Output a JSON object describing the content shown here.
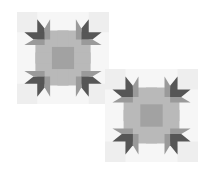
{
  "image": {
    "width": 209,
    "height": 174,
    "background": "#ffffff",
    "description": "Two overlapping grayscale quilt blocks (paw-style star pattern)"
  },
  "palette": {
    "corner_light": "#eeeeee",
    "field_light": "#f6f6f6",
    "octagon": "#b9b9b9",
    "center": "#a2a2a2",
    "paw_dark": "#565656",
    "paw_mid": "#9a9a9a",
    "paw_light": "#c8c8c8"
  },
  "blocks": [
    {
      "name": "quilt-block-top-left",
      "x": 17,
      "y": 12,
      "size": 92
    },
    {
      "name": "quilt-block-bottom-right",
      "x": 105,
      "y": 69,
      "size": 93
    }
  ]
}
